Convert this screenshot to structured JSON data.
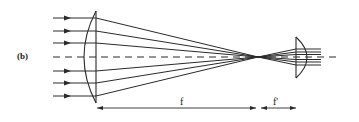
{
  "figure": {
    "panel_label": "(b)",
    "dimensions": {
      "first_focal_length_label": "f",
      "second_focal_length_label": "f'"
    },
    "colors": {
      "stroke": "#2a2a2a",
      "background": "#ffffff"
    },
    "elements": {
      "incoming_rays_count": 6,
      "optical_axis": "dashed",
      "large_lens": "plano-convex (curved face toward incoming light)",
      "small_lens": "plano-convex (curved face toward outgoing light)",
      "outgoing_rays_count": 7
    }
  }
}
